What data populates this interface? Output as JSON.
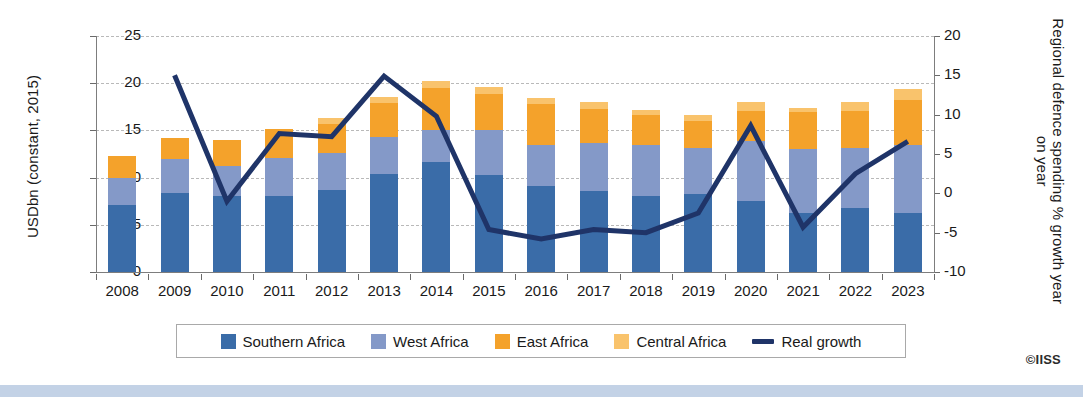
{
  "credit": "©IISS",
  "axes": {
    "left_title": "USDbn (constant, 2015)",
    "right_title": "Regional defence spending % growth year on year",
    "left_ticks": [
      "0",
      "5",
      "10",
      "15",
      "20",
      "25"
    ],
    "right_ticks": [
      "-10",
      "-5",
      "0",
      "5",
      "10",
      "15",
      "20"
    ]
  },
  "legend": {
    "items": [
      {
        "label": "Southern Africa",
        "type": "swatch",
        "color": "#3a6ca8"
      },
      {
        "label": "West Africa",
        "type": "swatch",
        "color": "#8499c8"
      },
      {
        "label": "East Africa",
        "type": "swatch",
        "color": "#f4a22b"
      },
      {
        "label": "Central Africa",
        "type": "swatch",
        "color": "#f9c36c"
      },
      {
        "label": "Real growth",
        "type": "line",
        "color": "#1f3468"
      }
    ]
  },
  "chart_data": {
    "type": "bar",
    "title": "",
    "subtitle": "",
    "xlabel": "",
    "ylabel": "USDbn (constant, 2015)",
    "y2label": "Regional defence spending % growth year on year",
    "ylim": [
      0,
      25
    ],
    "y2lim": [
      -10,
      20
    ],
    "grid": true,
    "legend_position": "bottom",
    "stacked": true,
    "categories": [
      "2008",
      "2009",
      "2010",
      "2011",
      "2012",
      "2013",
      "2014",
      "2015",
      "2016",
      "2017",
      "2018",
      "2019",
      "2020",
      "2021",
      "2022",
      "2023"
    ],
    "series": [
      {
        "name": "Southern Africa",
        "axis": "left",
        "color": "#3a6ca8",
        "values": [
          7.1,
          8.4,
          8.0,
          8.1,
          8.7,
          10.4,
          11.7,
          10.3,
          9.1,
          8.6,
          8.1,
          8.3,
          7.5,
          6.2,
          6.8,
          6.2
        ]
      },
      {
        "name": "West Africa",
        "axis": "left",
        "color": "#8499c8",
        "values": [
          2.9,
          3.6,
          3.2,
          4.0,
          3.9,
          3.9,
          3.3,
          4.7,
          4.4,
          5.1,
          5.4,
          4.8,
          6.4,
          6.8,
          6.3,
          7.3
        ]
      },
      {
        "name": "East Africa",
        "axis": "left",
        "color": "#f4a22b",
        "values": [
          2.3,
          2.2,
          2.8,
          3.0,
          3.1,
          3.6,
          4.5,
          3.9,
          4.3,
          3.6,
          3.1,
          2.9,
          3.2,
          3.9,
          4.0,
          4.7
        ]
      },
      {
        "name": "Central Africa",
        "axis": "left",
        "color": "#f9c36c",
        "values": [
          0.0,
          0.0,
          0.0,
          0.0,
          0.6,
          0.6,
          0.7,
          0.7,
          0.6,
          0.7,
          0.6,
          0.6,
          0.9,
          0.5,
          0.9,
          1.2
        ]
      },
      {
        "name": "Real growth",
        "axis": "right",
        "type": "line",
        "color": "#1f3468",
        "values": [
          null,
          15.0,
          -1.0,
          7.6,
          7.2,
          14.9,
          9.8,
          -4.6,
          -5.8,
          -4.6,
          -5.0,
          -2.5,
          8.6,
          -4.3,
          2.5,
          6.6
        ]
      }
    ]
  }
}
